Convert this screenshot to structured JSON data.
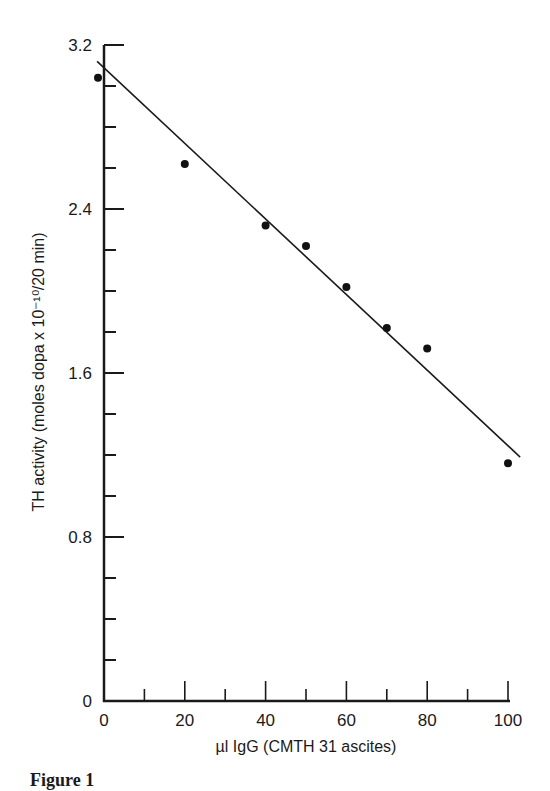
{
  "chart_data": {
    "type": "scatter",
    "title": "",
    "caption": "Figure 1",
    "xlabel": "µl IgG (CMTH 31 ascites)",
    "ylabel": "TH activity (moles dopa x 10⁻¹⁰/20 min)",
    "xlim": [
      0,
      100
    ],
    "ylim": [
      0,
      3.2
    ],
    "x_ticks": [
      "0",
      "20",
      "40",
      "60",
      "80",
      "100"
    ],
    "y_ticks": [
      "0",
      "0.8",
      "1.6",
      "2.4",
      "3.2"
    ],
    "grid": false,
    "legend": null,
    "series": [
      {
        "name": "TH activity",
        "type": "scatter",
        "x": [
          0,
          20,
          40,
          50,
          60,
          70,
          80,
          100
        ],
        "y": [
          3.04,
          2.62,
          2.32,
          2.22,
          2.02,
          1.82,
          1.72,
          1.16
        ]
      },
      {
        "name": "linear fit",
        "type": "line",
        "x": [
          -1.7,
          103
        ],
        "y": [
          3.12,
          1.19
        ]
      }
    ]
  }
}
